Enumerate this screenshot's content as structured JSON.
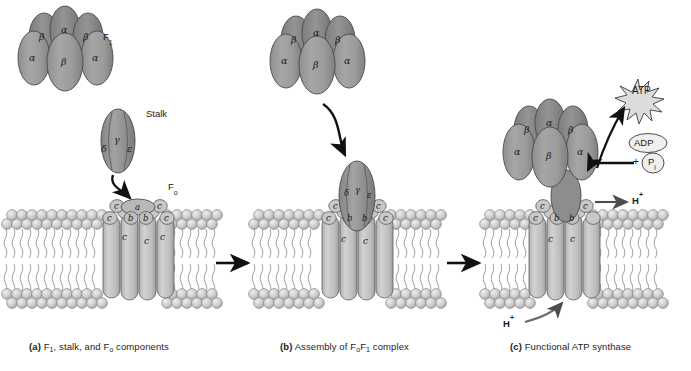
{
  "figure": {
    "title_panels": [
      {
        "tag": "(a)",
        "text": " F1, stalk, and Fo components",
        "label_a": "F",
        "sub1": "1",
        "mid": ", stalk, and F",
        "sub2": "o",
        "tail": " components"
      },
      {
        "tag": "(b)",
        "label": "Assembly of FoF1 complex"
      },
      {
        "tag": "(c)",
        "label": "Functional ATP synthase"
      }
    ],
    "colors": {
      "subunit_fill": "#9a9a9a",
      "subunit_fill_light": "#b5b5b5",
      "subunit_stroke": "#4a4a4a",
      "lipid_head": "#c9c9c9",
      "lipid_head_stroke": "#8a8a8a",
      "lipid_tail": "#a8a8a8",
      "c_subunit_fill": "#c2c2c2",
      "arrow": "#111111",
      "text": "#1c1c1c",
      "background": "#ffffff"
    }
  },
  "panel_a": {
    "caption_tag": "(a)",
    "caption_parts": {
      "p1": "F",
      "sub1": "1",
      "p2": ", stalk, and F",
      "sub2": "o",
      "p3": " components"
    },
    "f1_label": {
      "main": "F",
      "sub": "1"
    },
    "stalk_label": "Stalk",
    "fo_label": {
      "main": "F",
      "sub": "o"
    },
    "f1_subunits": [
      {
        "name": "β",
        "id": "beta-back-left"
      },
      {
        "name": "α",
        "id": "alpha-back-top"
      },
      {
        "name": "β",
        "id": "beta-back-right"
      },
      {
        "name": "α",
        "id": "alpha-front-left"
      },
      {
        "name": "β",
        "id": "beta-front-center"
      },
      {
        "name": "α",
        "id": "alpha-front-right"
      }
    ],
    "stalk_subunits": [
      {
        "name": "γ",
        "id": "gamma"
      },
      {
        "name": "δ",
        "id": "delta"
      },
      {
        "name": "ε",
        "id": "epsilon"
      }
    ],
    "fo_subunits": [
      {
        "name": "a",
        "id": "subunit-a"
      },
      {
        "name": "b",
        "id": "subunit-b-left"
      },
      {
        "name": "b",
        "id": "subunit-b-right"
      },
      {
        "name": "c",
        "id": "c-1"
      },
      {
        "name": "c",
        "id": "c-2"
      },
      {
        "name": "c",
        "id": "c-3"
      },
      {
        "name": "c",
        "id": "c-4"
      },
      {
        "name": "c",
        "id": "c-5"
      },
      {
        "name": "c",
        "id": "c-6"
      },
      {
        "name": "c",
        "id": "c-7"
      }
    ]
  },
  "panel_b": {
    "caption_tag": "(b)",
    "caption_parts": {
      "p1": "Assembly of F",
      "sub1": "o",
      "p2": "F",
      "sub2": "1",
      "p3": " complex"
    },
    "f1_subunits": [
      {
        "name": "β",
        "id": "beta-back-left"
      },
      {
        "name": "α",
        "id": "alpha-back-top"
      },
      {
        "name": "β",
        "id": "beta-back-right"
      },
      {
        "name": "α",
        "id": "alpha-front-left"
      },
      {
        "name": "β",
        "id": "beta-front-center"
      },
      {
        "name": "α",
        "id": "alpha-front-right"
      }
    ],
    "stalk_subunits": [
      {
        "name": "δ",
        "id": "delta"
      },
      {
        "name": "γ",
        "id": "gamma"
      },
      {
        "name": "ε",
        "id": "epsilon"
      }
    ],
    "fo_subunits": [
      {
        "name": "b",
        "id": "subunit-b-left"
      },
      {
        "name": "b",
        "id": "subunit-b-right"
      },
      {
        "name": "c",
        "id": "c-1"
      },
      {
        "name": "c",
        "id": "c-2"
      },
      {
        "name": "c",
        "id": "c-3"
      },
      {
        "name": "c",
        "id": "c-4"
      },
      {
        "name": "c",
        "id": "c-5"
      },
      {
        "name": "c",
        "id": "c-6"
      }
    ]
  },
  "panel_c": {
    "caption_tag": "(c)",
    "caption_parts": {
      "p1": "Functional ATP synthase"
    },
    "atp_label": "ATP",
    "adp_label": "ADP",
    "pi_label": {
      "main": "P",
      "sub": "i"
    },
    "plus_label": "+",
    "proton_out_label": {
      "main": "H",
      "sup": "+"
    },
    "proton_in_label": {
      "main": "H",
      "sup": "+"
    },
    "f1_subunits": [
      {
        "name": "β",
        "id": "beta-back-left"
      },
      {
        "name": "α",
        "id": "alpha-back-top"
      },
      {
        "name": "β",
        "id": "beta-back-right"
      },
      {
        "name": "α",
        "id": "alpha-front-left"
      },
      {
        "name": "β",
        "id": "beta-front-center"
      },
      {
        "name": "α",
        "id": "alpha-front-right"
      }
    ],
    "fo_subunits": [
      {
        "name": "b",
        "id": "subunit-b-left"
      },
      {
        "name": "b",
        "id": "subunit-b-right"
      },
      {
        "name": "c",
        "id": "c-1"
      },
      {
        "name": "c",
        "id": "c-2"
      },
      {
        "name": "c",
        "id": "c-3"
      },
      {
        "name": "c",
        "id": "c-4"
      },
      {
        "name": "c",
        "id": "c-5"
      }
    ]
  }
}
